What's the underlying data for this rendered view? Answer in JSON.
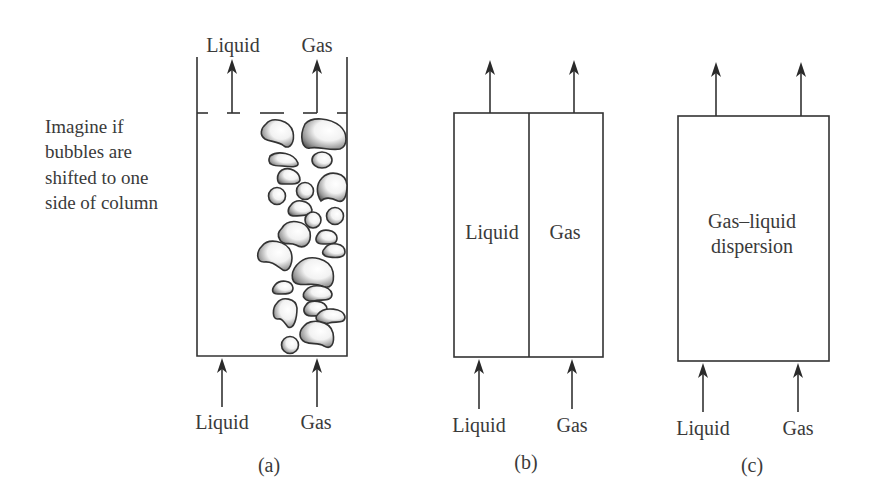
{
  "note": {
    "lines": [
      "Imagine if",
      "bubbles are",
      "shifted to one",
      "side of column"
    ]
  },
  "panels": [
    {
      "caption": "(a)",
      "outlet_labels": {
        "liquid": "Liquid",
        "gas": "Gas"
      },
      "inlet_labels": {
        "liquid": "Liquid",
        "gas": "Gas"
      }
    },
    {
      "caption": "(b)",
      "inner_labels": {
        "liquid": "Liquid",
        "gas": "Gas"
      },
      "inlet_labels": {
        "liquid": "Liquid",
        "gas": "Gas"
      }
    },
    {
      "caption": "(c)",
      "inner_label_lines": [
        "Gas–liquid",
        "dispersion"
      ],
      "inlet_labels": {
        "liquid": "Liquid",
        "gas": "Gas"
      }
    }
  ],
  "colors": {
    "stroke": "#333333",
    "text": "#3a3a3a",
    "background": "#ffffff"
  }
}
